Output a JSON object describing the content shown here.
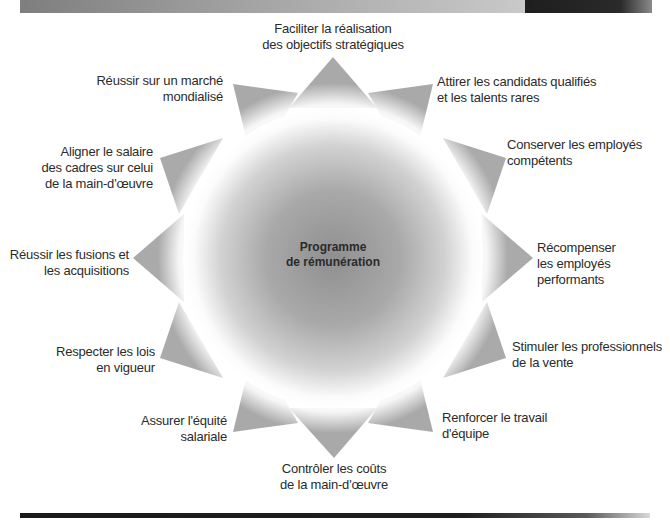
{
  "diagram": {
    "center": {
      "lines": [
        "Programme",
        "de rémunération"
      ]
    },
    "objectives": [
      {
        "id": "strategic",
        "lines": [
          "Faciliter la réalisation",
          "des objectifs stratégiques"
        ]
      },
      {
        "id": "attract",
        "lines": [
          "Attirer les candidats qualifiés",
          "et les talents rares"
        ]
      },
      {
        "id": "retain",
        "lines": [
          "Conserver les employés",
          "compétents"
        ]
      },
      {
        "id": "reward",
        "lines": [
          "Récompenser",
          "les employés",
          "performants"
        ]
      },
      {
        "id": "sales",
        "lines": [
          "Stimuler les professionnels",
          "de la vente"
        ]
      },
      {
        "id": "teamwork",
        "lines": [
          "Renforcer le travail",
          "d'équipe"
        ]
      },
      {
        "id": "labor-costs",
        "lines": [
          "Contrôler les coûts",
          "de la main-d'œuvre"
        ]
      },
      {
        "id": "pay-equity",
        "lines": [
          "Assurer l'équité",
          "salariale"
        ]
      },
      {
        "id": "laws",
        "lines": [
          "Respecter les lois",
          "en vigueur"
        ]
      },
      {
        "id": "mergers",
        "lines": [
          "Réussir les fusions et",
          "les acquisitions"
        ]
      },
      {
        "id": "executive-pay",
        "lines": [
          "Aligner le salaire",
          "des cadres sur celui",
          "de la main-d'œuvre"
        ]
      },
      {
        "id": "global-market",
        "lines": [
          "Réussir sur un marché",
          "mondialisé"
        ]
      }
    ],
    "colors": {
      "spike": "#a8a8a8",
      "center_core": "#9a9a9a",
      "halo": "#ffffff",
      "text": "#2b2b2b",
      "header_bar": "#9a9a9a",
      "header_dark": "#222222",
      "rule": "#1e1e1e"
    }
  }
}
